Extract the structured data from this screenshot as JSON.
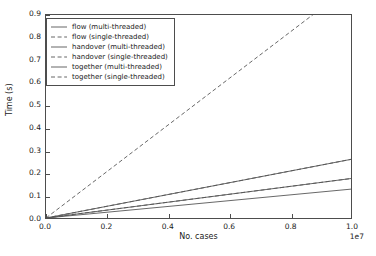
{
  "chart_data": {
    "type": "line",
    "title": "",
    "xlabel": "No. cases",
    "ylabel": "Time (s)",
    "xlim": [
      0,
      10000000
    ],
    "ylim": [
      0.0,
      0.9
    ],
    "x_offset_text": "1e7",
    "x_tick_labels": [
      "0.0",
      "0.2",
      "0.4",
      "0.6",
      "0.8",
      "1.0"
    ],
    "x_tick_values": [
      0,
      2000000,
      4000000,
      6000000,
      8000000,
      10000000
    ],
    "y_tick_labels": [
      "0.0",
      "0.1",
      "0.2",
      "0.3",
      "0.4",
      "0.5",
      "0.6",
      "0.7",
      "0.8",
      "0.9"
    ],
    "y_tick_values": [
      0.0,
      0.1,
      0.2,
      0.3,
      0.4,
      0.5,
      0.6,
      0.7,
      0.8,
      0.9
    ],
    "grid": false,
    "legend_position": "upper left",
    "x": [
      0,
      10000000
    ],
    "series": [
      {
        "name": "flow (multi-threaded)",
        "style": "solid",
        "color": "#555555",
        "values": [
          0.0,
          0.128
        ]
      },
      {
        "name": "flow (single-threaded)",
        "style": "dashed",
        "color": "#555555",
        "values": [
          0.0,
          0.175
        ]
      },
      {
        "name": "handover (multi-threaded)",
        "style": "solid",
        "color": "#555555",
        "values": [
          0.0,
          0.175
        ]
      },
      {
        "name": "handover (single-threaded)",
        "style": "dashed",
        "color": "#555555",
        "values": [
          0.0,
          0.26
        ]
      },
      {
        "name": "together (multi-threaded)",
        "style": "solid",
        "color": "#555555",
        "values": [
          0.0,
          0.26
        ]
      },
      {
        "name": "together (single-threaded)",
        "style": "dashed",
        "color": "#555555",
        "values": [
          0.0,
          1.03
        ]
      }
    ],
    "legend_entries": [
      "flow (multi-threaded)",
      "flow (single-threaded)",
      "handover (multi-threaded)",
      "handover (single-threaded)",
      "together (multi-threaded)",
      "together (single-threaded)"
    ]
  }
}
